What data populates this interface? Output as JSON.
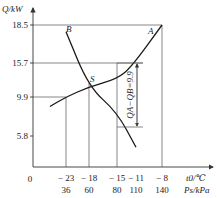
{
  "chart_data": {
    "type": "line",
    "title": "",
    "ylabel": "Q/kW",
    "xlabel_primary": "t0/℃",
    "xlabel_secondary": "Ps/kPa",
    "origin_label": "0",
    "x_ticks": [
      {
        "t": -23,
        "p": 36
      },
      {
        "t": -18,
        "p": 60
      },
      {
        "t": -15,
        "p": 80
      },
      {
        "t": -11,
        "p": 110
      },
      {
        "t": -8,
        "p": 140
      }
    ],
    "y_ticks": [
      5.8,
      9.9,
      15.7,
      18.5
    ],
    "series": [
      {
        "name": "A",
        "points": [
          [
            -26.5,
            8.9
          ],
          [
            -23,
            9.9
          ],
          [
            -18,
            11.6
          ],
          [
            -15,
            13.0
          ],
          [
            -12,
            15.0
          ],
          [
            -8,
            18.5
          ]
        ]
      },
      {
        "name": "B",
        "points": [
          [
            -23,
            18.0
          ],
          [
            -18,
            11.6
          ],
          [
            -15,
            8.3
          ],
          [
            -11,
            3.7
          ]
        ]
      }
    ],
    "intersection": {
      "label": "S",
      "t": -18,
      "Q": 11.6
    },
    "annotation": {
      "text": "QA−QB=9.9",
      "from": 15.7,
      "to": 5.8,
      "at_t": -15
    }
  }
}
